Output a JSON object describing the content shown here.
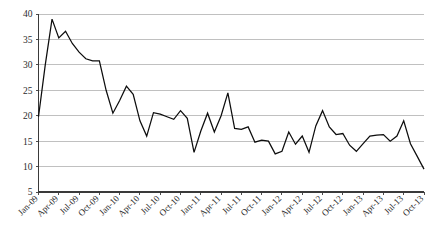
{
  "chart_data": {
    "type": "line",
    "title": "",
    "subtitle": "",
    "xlabel": "",
    "ylabel": "",
    "ylim": [
      5,
      40
    ],
    "ytick_values": [
      5,
      10,
      15,
      20,
      25,
      30,
      35,
      40
    ],
    "ytick_labels": [
      "5",
      "10",
      "15",
      "20",
      "25",
      "30",
      "35",
      "40"
    ],
    "grid": true,
    "legend": false,
    "legend_position": "none",
    "line_color": "#0d0d0d",
    "grid_color": "#b9b9b9",
    "axis_color": "#3a3a3a",
    "background_color": "#ffffff",
    "xtick_labels": [
      "Jan-09",
      "Apr-09",
      "Jul-09",
      "Oct-09",
      "Jan-10",
      "Apr-10",
      "Jul-10",
      "Oct-10",
      "Jan-11",
      "Apr-11",
      "Jul-11",
      "Oct-11",
      "Jan-12",
      "Apr-12",
      "Jul-12",
      "Oct-12",
      "Jan-13",
      "Apr-13",
      "Jul-13",
      "Oct-13"
    ],
    "xtick_interval_months": 3,
    "x": [
      "Jan-09",
      "Feb-09",
      "Mar-09",
      "Apr-09",
      "May-09",
      "Jun-09",
      "Jul-09",
      "Aug-09",
      "Sep-09",
      "Oct-09",
      "Nov-09",
      "Dec-09",
      "Jan-10",
      "Feb-10",
      "Mar-10",
      "Apr-10",
      "May-10",
      "Jun-10",
      "Jul-10",
      "Aug-10",
      "Sep-10",
      "Oct-10",
      "Nov-10",
      "Dec-10",
      "Jan-11",
      "Feb-11",
      "Mar-11",
      "Apr-11",
      "May-11",
      "Jun-11",
      "Jul-11",
      "Aug-11",
      "Sep-11",
      "Oct-11",
      "Nov-11",
      "Dec-11",
      "Jan-12",
      "Feb-12",
      "Mar-12",
      "Apr-12",
      "May-12",
      "Jun-12",
      "Jul-12",
      "Aug-12",
      "Sep-12",
      "Oct-12",
      "Nov-12",
      "Dec-12",
      "Jan-13",
      "Feb-13",
      "Mar-13",
      "Apr-13",
      "May-13",
      "Jun-13",
      "Jul-13",
      "Aug-13",
      "Sep-13",
      "Oct-13"
    ],
    "values": [
      19.8,
      30.0,
      39.0,
      35.3,
      36.6,
      34.2,
      32.5,
      31.2,
      30.8,
      30.8,
      25.0,
      20.5,
      23.0,
      25.8,
      24.2,
      19.0,
      16.0,
      20.6,
      20.3,
      19.8,
      19.3,
      21.0,
      19.5,
      12.8,
      17.0,
      20.5,
      16.8,
      20.0,
      24.5,
      17.5,
      17.3,
      17.8,
      14.8,
      15.2,
      15.0,
      12.5,
      13.0,
      16.8,
      14.4,
      16.0,
      12.8,
      18.0,
      21.0,
      17.8,
      16.3,
      16.5,
      14.2,
      13.0,
      14.5,
      16.0,
      16.2,
      16.3,
      15.0,
      16.0,
      19.0,
      14.5,
      12.0,
      9.5
    ]
  }
}
